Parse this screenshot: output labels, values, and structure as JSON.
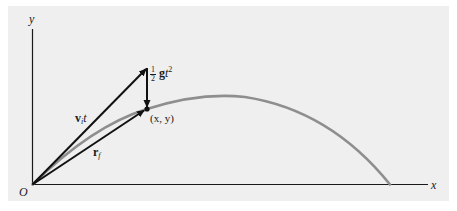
{
  "figure": {
    "type": "projectile-motion-vector-diagram",
    "axes": {
      "x_label": "x",
      "y_label": "y",
      "origin_label": "O"
    },
    "vectors": [
      {
        "name": "initial-velocity-times-time",
        "label_main": "v",
        "label_sub": "i",
        "label_suffix": "t"
      },
      {
        "name": "final-position",
        "label_main": "r",
        "label_sub": "f"
      },
      {
        "name": "gravity-displacement",
        "frac_num": "1",
        "frac_den": "2",
        "label_main": "g",
        "label_var": "t",
        "label_sup": "2"
      }
    ],
    "point": {
      "label": "(x, y)"
    },
    "colors": {
      "background": "#efeff0",
      "axes": "#1a1a1a",
      "vectors": "#111111",
      "trajectory": "#8e8e8e"
    }
  }
}
